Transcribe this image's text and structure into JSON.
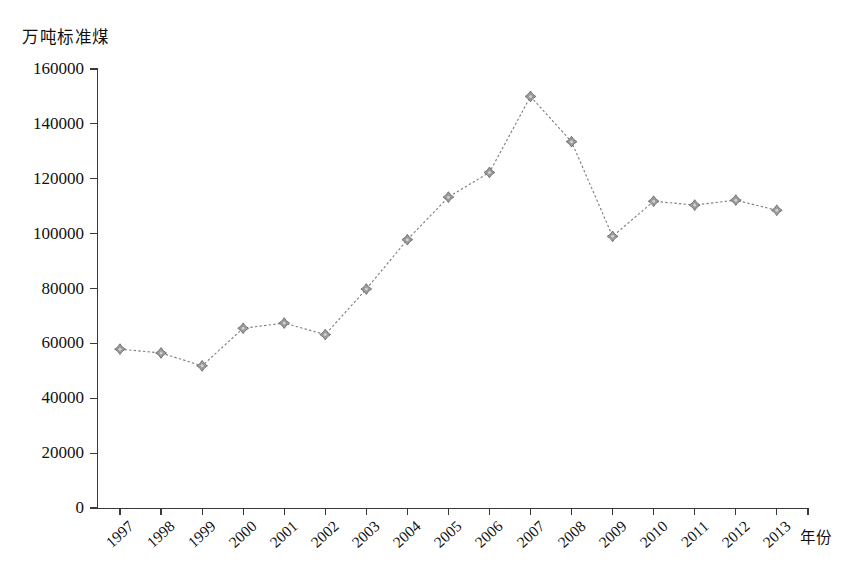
{
  "chart_data": {
    "type": "line",
    "title": "",
    "subtitle": "",
    "unit_label": "万吨标准煤",
    "xlabel": "年份",
    "ylabel": "",
    "categories": [
      "1997",
      "1998",
      "1999",
      "2000",
      "2001",
      "2002",
      "2003",
      "2004",
      "2005",
      "2006",
      "2007",
      "2008",
      "2009",
      "2010",
      "2011",
      "2012",
      "2013"
    ],
    "values": [
      57900,
      56500,
      51800,
      65500,
      67400,
      63200,
      79800,
      97800,
      113300,
      122300,
      150000,
      133500,
      99000,
      111800,
      110400,
      112200,
      108500
    ],
    "series": [
      {
        "name": "万吨标准煤",
        "values": [
          57900,
          56500,
          51800,
          65500,
          67400,
          63200,
          79800,
          97800,
          113300,
          122300,
          150000,
          133500,
          99000,
          111800,
          110400,
          112200,
          108500
        ]
      }
    ],
    "ylim": [
      0,
      160000
    ],
    "yticks": [
      0,
      20000,
      40000,
      60000,
      80000,
      100000,
      120000,
      140000,
      160000
    ],
    "ytick_labels": [
      "0",
      "20000",
      "40000",
      "60000",
      "80000",
      "100000",
      "120000",
      "140000",
      "160000"
    ],
    "xtick_rotation": -42,
    "grid": false,
    "legend": false,
    "legend_position": "none",
    "line_style": "dotted",
    "marker": "diamond-cross",
    "colors": {
      "line": "#808080",
      "marker_fill": "#9a9a9a",
      "marker_stroke": "#6e6e6e",
      "axis": "#3a3a3a",
      "text": "#111111",
      "background": "#ffffff"
    }
  }
}
